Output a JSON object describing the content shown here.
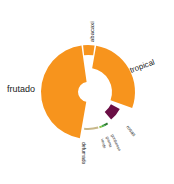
{
  "chart_data": {
    "type": "sunburst",
    "title": "",
    "center": [
      88,
      92
    ],
    "segments": [
      {
        "name": "frutado",
        "start": 190,
        "end": 352,
        "inner": 10,
        "outer": 47,
        "color": "#f7941d",
        "label_size": 9
      },
      {
        "name": "abacaxi",
        "start": 354,
        "end": 8,
        "inner": 37,
        "outer": 47,
        "color": "#f7941d",
        "label_size": 6
      },
      {
        "name": "tropical",
        "start": 10,
        "end": 110,
        "inner": 24,
        "outer": 47,
        "color": "#f7941d",
        "label_size": 8
      },
      {
        "name": "rosas",
        "start": 118,
        "end": 140,
        "inner": 26,
        "outer": 36,
        "color": "#6b0f45",
        "label_size": 5
      },
      {
        "name": "gorduroso",
        "start": 148,
        "end": 154,
        "inner": 36,
        "outer": 38,
        "color": "#2e7d32",
        "label_size": 4
      },
      {
        "name": "grama",
        "start": 154,
        "end": 158,
        "inner": 36,
        "outer": 38,
        "color": "#4caf50",
        "label_size": 4
      },
      {
        "name": "verde",
        "start": 158,
        "end": 162,
        "inner": 36,
        "outer": 38,
        "color": "#8bc34a",
        "label_size": 4
      },
      {
        "name": "defumado",
        "start": 164,
        "end": 186,
        "inner": 36,
        "outer": 38,
        "color": "#c8b88a",
        "label_size": 5
      }
    ],
    "labels": [
      {
        "text": "frutado",
        "x": 7,
        "y": 92,
        "rotate": 0,
        "size": 9
      },
      {
        "text": "abacaxi",
        "x": 94,
        "y": 42,
        "rotate": -90,
        "size": 6
      },
      {
        "text": "tropical",
        "x": 131,
        "y": 73,
        "rotate": -20,
        "size": 8
      },
      {
        "text": "rosas",
        "x": 126,
        "y": 127,
        "rotate": 52,
        "size": 5
      },
      {
        "text": "gorduroso",
        "x": 111,
        "y": 135,
        "rotate": 65,
        "size": 4
      },
      {
        "text": "grama",
        "x": 106,
        "y": 137,
        "rotate": 70,
        "size": 4
      },
      {
        "text": "verde",
        "x": 101,
        "y": 139,
        "rotate": 76,
        "size": 4
      },
      {
        "text": "defumado",
        "x": 82,
        "y": 142,
        "rotate": 90,
        "size": 5
      }
    ]
  }
}
